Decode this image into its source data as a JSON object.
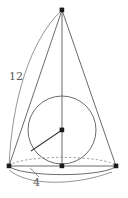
{
  "figure": {
    "labels": {
      "slant_height": "12",
      "base_radius": "4"
    },
    "colors": {
      "stroke": "#5a5a5a",
      "dash_stroke": "#7a7a7a",
      "point_fill": "#1a1a1a",
      "background": "#ffffff"
    },
    "geometry": {
      "apex": {
        "x": 62,
        "y": 10
      },
      "base_center": {
        "x": 62,
        "y": 166
      },
      "base_left": {
        "x": 9,
        "y": 166
      },
      "base_right": {
        "x": 116,
        "y": 166
      },
      "base_ellipse": {
        "cx": 62,
        "cy": 166,
        "rx": 54,
        "ry": 10
      },
      "sphere_circle": {
        "cx": 62,
        "cy": 130,
        "r": 34
      },
      "sphere_center": {
        "x": 62,
        "y": 130
      },
      "radius_endpoint": {
        "x": 31,
        "y": 151
      }
    }
  }
}
